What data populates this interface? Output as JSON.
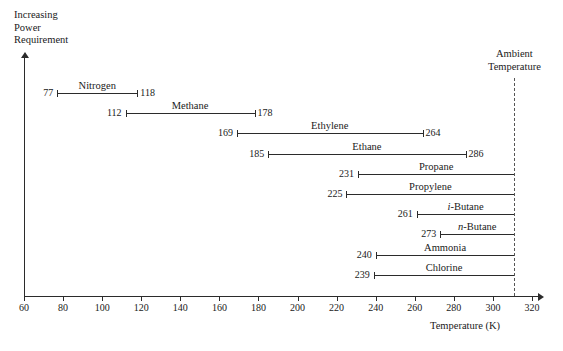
{
  "chart_data": {
    "type": "bar",
    "orientation": "horizontal-range",
    "title": "",
    "xlabel": "Temperature (K)",
    "ylabel": "Increasing\nPower\nRequirement",
    "xlim": [
      60,
      320
    ],
    "xticks": [
      60,
      80,
      100,
      120,
      140,
      160,
      180,
      200,
      220,
      240,
      260,
      280,
      300,
      320
    ],
    "grid": false,
    "legend": null,
    "annotations": [
      {
        "name": "ambient-temperature",
        "label": "Ambient\nTemperature",
        "value": 311,
        "style": "dashed-vertical-line"
      }
    ],
    "series": [
      {
        "name": "Nitrogen",
        "label": "Nitrogen",
        "start": 77,
        "end": 118,
        "start_label": "77",
        "end_label": "118",
        "ends_at_ambient": false
      },
      {
        "name": "Methane",
        "label": "Methane",
        "start": 112,
        "end": 178,
        "start_label": "112",
        "end_label": "178",
        "ends_at_ambient": false
      },
      {
        "name": "Ethylene",
        "label": "Ethylene",
        "start": 169,
        "end": 264,
        "start_label": "169",
        "end_label": "264",
        "ends_at_ambient": false
      },
      {
        "name": "Ethane",
        "label": "Ethane",
        "start": 185,
        "end": 286,
        "start_label": "185",
        "end_label": "286",
        "ends_at_ambient": false
      },
      {
        "name": "Propane",
        "label": "Propane",
        "start": 231,
        "end": 311,
        "start_label": "231",
        "end_label": "",
        "ends_at_ambient": true
      },
      {
        "name": "Propylene",
        "label": "Propylene",
        "start": 225,
        "end": 311,
        "start_label": "225",
        "end_label": "",
        "ends_at_ambient": true
      },
      {
        "name": "i-Butane",
        "label": "i-Butane",
        "start": 261,
        "end": 311,
        "start_label": "261",
        "end_label": "",
        "ends_at_ambient": true,
        "italic_prefix": "i"
      },
      {
        "name": "n-Butane",
        "label": "n-Butane",
        "start": 273,
        "end": 311,
        "start_label": "273",
        "end_label": "",
        "ends_at_ambient": true,
        "italic_prefix": "n"
      },
      {
        "name": "Ammonia",
        "label": "Ammonia",
        "start": 240,
        "end": 311,
        "start_label": "240",
        "end_label": "",
        "ends_at_ambient": true
      },
      {
        "name": "Chlorine",
        "label": "Chlorine",
        "start": 239,
        "end": 311,
        "start_label": "239",
        "end_label": "",
        "ends_at_ambient": true
      }
    ]
  },
  "colors": {
    "line": "#2b2b2b",
    "dashed": "#555555",
    "background": "#ffffff",
    "text": "#1a1a1a"
  }
}
